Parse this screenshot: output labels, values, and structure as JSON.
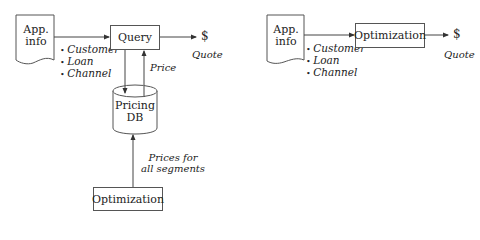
{
  "left_diagram": {
    "app_info": {
      "line1": "App.",
      "line2": "info"
    },
    "attributes": [
      "Customer",
      "Loan",
      "Channel"
    ],
    "query_box": "Query",
    "output_symbol": "$",
    "output_label": "Quote",
    "price_label": "Price",
    "database": {
      "line1": "Pricing",
      "line2": "DB"
    },
    "prices_label": {
      "line1": "Prices for",
      "line2": "all segments"
    },
    "optimization_box": "Optimization"
  },
  "right_diagram": {
    "app_info": {
      "line1": "App.",
      "line2": "info"
    },
    "attributes": [
      "Customer",
      "Loan",
      "Channel"
    ],
    "optimization_box": "Optimization",
    "output_symbol": "$",
    "output_label": "Quote"
  }
}
